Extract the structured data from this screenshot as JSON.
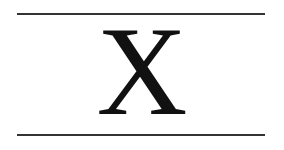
{
  "figure": {
    "symbol": "X",
    "rules": [
      "top",
      "bottom"
    ],
    "colors": {
      "line": "#333333",
      "glyph": "#111111",
      "background": "#ffffff"
    }
  }
}
